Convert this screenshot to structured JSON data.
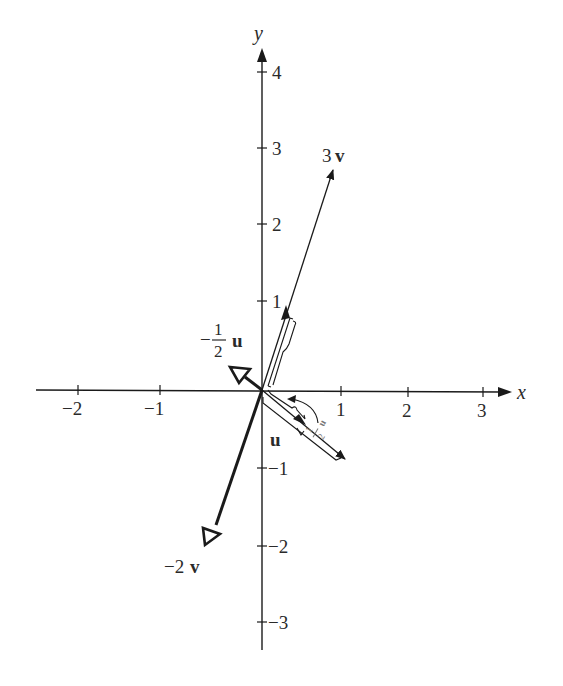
{
  "diagram": {
    "type": "vector-scalar-multiples",
    "axes": {
      "x_label": "x",
      "y_label": "y",
      "x_ticks": [
        "−2",
        "−1",
        "1",
        "2",
        "3"
      ],
      "y_ticks": [
        "4",
        "3",
        "2",
        "1",
        "−1",
        "−2",
        "−3"
      ]
    },
    "vectors": [
      {
        "id": "3v",
        "coef": "3",
        "name": "v",
        "style": "thin"
      },
      {
        "id": "-2v",
        "coef": "−2",
        "name": "v",
        "style": "thick-open-arrow"
      },
      {
        "id": "u",
        "coef": "",
        "name": "u",
        "style": "thin"
      },
      {
        "id": "-1/2u",
        "coef_sign": "−",
        "coef_num": "1",
        "coef_den": "2",
        "name": "u",
        "style": "thick-open-arrow"
      },
      {
        "id": "1/2u-rotated",
        "coef_num": "1",
        "coef_den": "2",
        "name": "u",
        "style": "thin-gray"
      }
    ],
    "colors": {
      "ink": "#1a1a1a",
      "faint": "#777777",
      "background": "#ffffff"
    }
  }
}
